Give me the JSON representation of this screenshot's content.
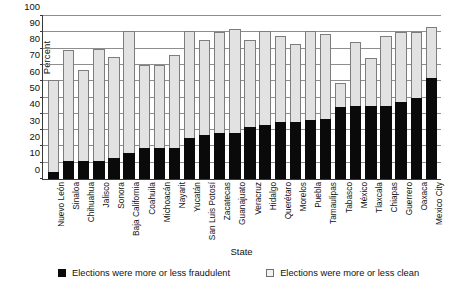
{
  "chart_data": {
    "type": "bar",
    "stacked": true,
    "title": "",
    "xlabel": "State",
    "ylabel": "Percent",
    "ylim": [
      0,
      100
    ],
    "yticks": [
      0,
      10,
      20,
      30,
      40,
      50,
      60,
      70,
      80,
      90,
      100
    ],
    "grid": true,
    "legend_position": "bottom",
    "categories": [
      "Nuevo León",
      "Sinaloa",
      "Chihuahua",
      "Jalisco",
      "Sonora",
      "Baja California",
      "Coahuila",
      "Michoacán",
      "Nayarit",
      "Yucatán",
      "San Luis Potosí",
      "Zacatecas",
      "Guanajuato",
      "Veracruz",
      "Hidalgo",
      "Querétaro",
      "Morelos",
      "Puebla",
      "Tamaulipas",
      "Tabasco",
      "México",
      "Tlaxcala",
      "Chiapas",
      "Guerrero",
      "Oaxaca",
      "Mexico City"
    ],
    "series": [
      {
        "name": "Elections were more or less fraudulent",
        "color": "#0a0a0a",
        "values": [
          4,
          11,
          11,
          11,
          13,
          16,
          19,
          19,
          19,
          25,
          27,
          28,
          28,
          32,
          33,
          35,
          35,
          36,
          37,
          44,
          45,
          45,
          45,
          47,
          50,
          62
        ]
      },
      {
        "name": "Elections were more or less clean",
        "color": "#e2e2e2",
        "values": [
          61,
          79,
          67,
          80,
          75,
          91,
          70,
          70,
          76,
          91,
          85,
          90,
          92,
          85,
          91,
          88,
          83,
          91,
          89,
          59,
          84,
          74,
          88,
          90,
          90,
          93
        ]
      }
    ]
  },
  "legend": {
    "items": [
      {
        "label": "Elections were more or less fraudulent",
        "style": "dark"
      },
      {
        "label": "Elections were more or less clean",
        "style": "light"
      }
    ]
  },
  "axes": {
    "y_title": "Percent",
    "x_title": "State"
  }
}
